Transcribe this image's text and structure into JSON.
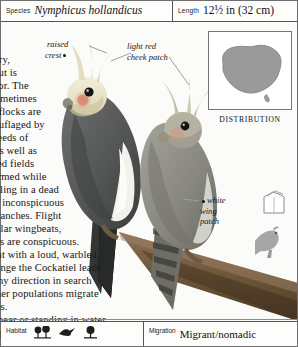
{
  "header": {
    "species_label": "Species",
    "species_value": "Nymphicus hollandicus",
    "length_label": "Length",
    "length_value": "12½ in (32 cm)"
  },
  "body_text": "untry,\no but is\navior. The\n, sometimes\nall flocks are\nmouflaged by\nn seeds of\ns, as well as\nested fields\nalarmed while\nsettling in a dead\nves inconspicuous\nr branches. Flight\negular wingbeats,\nches are conspicuous.\nlight with a loud, warbled,\ns range the Cockatiel leads\nn any direction in search\nOther populations migrate\nnges.\nen near or standing in water.\nxcept for wetter coastal areas.",
  "annotations": {
    "crest": "raised\ncrest",
    "cheek": "light red\ncheek patch",
    "wing": "white\nwing\npatch"
  },
  "distribution": {
    "label": "DISTRIBUTION",
    "region": "Australia",
    "fill_color": "#9a9a9a"
  },
  "icons": {
    "nestbox": "nest-box-icon",
    "perched_bird": "perched-bird-silhouette-icon",
    "habitat_1": "shrubland-icon",
    "habitat_2": "arid-flight-icon",
    "habitat_3": "woodland-tree-icon"
  },
  "footer": {
    "habitat_label": "Habitat",
    "migration_label": "Migration",
    "migration_value": "Migrant/nomadic"
  },
  "colors": {
    "border": "#555555",
    "page_bg": "#fbfbf9",
    "map_fill": "#9a9a9a",
    "male_body": "#5d5f5e",
    "male_face": "#e8e2c8",
    "female_body": "#8d8d86",
    "cheek_patch": "#d98a72",
    "branch": "#7a5f44"
  }
}
